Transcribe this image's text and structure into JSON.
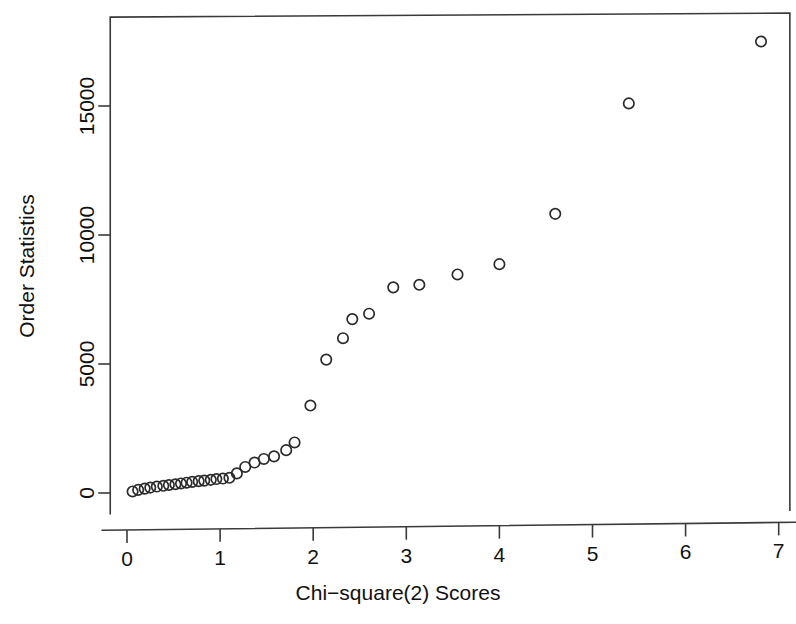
{
  "chart_data": {
    "type": "scatter",
    "title": "",
    "subtitle": "",
    "xlabel": "Chi−square(2) Scores",
    "ylabel": "Order Statistics",
    "xlim": [
      -0.18,
      7.12
    ],
    "ylim": [
      -900,
      18600
    ],
    "xticks": [
      0,
      1,
      2,
      3,
      4,
      5,
      6,
      7
    ],
    "xticklabels": [
      "0",
      "1",
      "2",
      "3",
      "4",
      "5",
      "6",
      "7"
    ],
    "yticks": [
      0,
      5000,
      10000,
      15000
    ],
    "yticklabels": [
      "0",
      "5000",
      "10000",
      "15000"
    ],
    "grid": false,
    "legend": null,
    "marker": "open-circle",
    "marker_radius_px": 5.2,
    "series": [
      {
        "name": "Order statistics vs chi-square(2) quantiles",
        "x": [
          0.06,
          0.12,
          0.19,
          0.25,
          0.32,
          0.39,
          0.45,
          0.52,
          0.58,
          0.64,
          0.7,
          0.77,
          0.83,
          0.9,
          0.96,
          1.03,
          1.1,
          1.18,
          1.27,
          1.37,
          1.47,
          1.58,
          1.71,
          1.8,
          1.97,
          2.14,
          2.32,
          2.42,
          2.6,
          2.86,
          3.14,
          3.55,
          4.0,
          4.6,
          5.39,
          6.81
        ],
        "y": [
          60,
          120,
          170,
          210,
          250,
          280,
          310,
          340,
          370,
          400,
          430,
          460,
          480,
          510,
          540,
          560,
          590,
          760,
          1010,
          1180,
          1320,
          1420,
          1660,
          1960,
          3390,
          5170,
          6000,
          6740,
          6950,
          7970,
          8070,
          8470,
          8870,
          10820,
          15100,
          17500
        ]
      }
    ]
  },
  "axes": {
    "x_axis_name": "chi-square-axis",
    "y_axis_name": "order-statistics-axis"
  }
}
